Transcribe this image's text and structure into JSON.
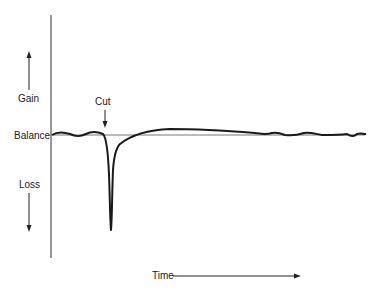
{
  "diagram": {
    "y_axis": {
      "gain_label": "Gain",
      "balance_label": "Balance",
      "loss_label": "Loss"
    },
    "x_axis": {
      "label": "Time"
    },
    "annotations": {
      "cut_label": "Cut"
    }
  },
  "colors": {
    "line": "#1a1a1a",
    "baseline": "#777777",
    "background": "#ffffff"
  }
}
